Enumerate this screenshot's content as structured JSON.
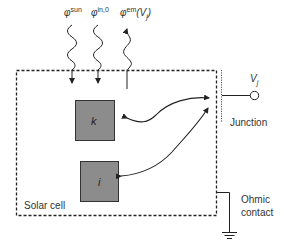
{
  "diagram": {
    "fluxes": [
      {
        "symbol": "φ",
        "superscript": "sun",
        "suffix": "",
        "direction": "in"
      },
      {
        "symbol": "φ",
        "superscript": "in,0",
        "suffix": "",
        "direction": "in"
      },
      {
        "symbol": "φ",
        "superscript": "em",
        "suffix": "(V",
        "subscript": "j",
        "close": ")",
        "direction": "out"
      }
    ],
    "states": [
      {
        "label": "k",
        "color": "#8c8c8c"
      },
      {
        "label": "i",
        "color": "#8c8c8c"
      }
    ],
    "region_label": "Solar cell",
    "junction_label": "Junction",
    "voltage_label": "V",
    "voltage_subscript": "j",
    "contact_label_line1": "Ohmic",
    "contact_label_line2": "contact",
    "colors": {
      "line": "#222222",
      "box_fill": "#8c8c8c",
      "box_border": "#333333"
    }
  }
}
